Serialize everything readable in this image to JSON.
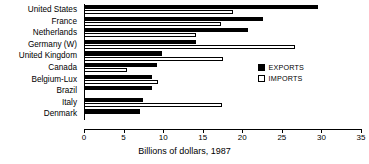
{
  "chart_data": {
    "type": "bar",
    "orientation": "horizontal",
    "title": "",
    "xlabel": "Billions of dollars, 1987",
    "ylabel": "",
    "xlim": [
      0,
      35
    ],
    "xticks": [
      0,
      5,
      10,
      15,
      20,
      25,
      30,
      35
    ],
    "xtick_labels": [
      "0",
      "5",
      "10",
      "15",
      "20",
      "25",
      "30",
      "35"
    ],
    "grid": false,
    "legend_position": "center-right",
    "categories": [
      "United States",
      "France",
      "Netherlands",
      "Germany (W)",
      "United Kingdom",
      "Canada",
      "Belgium-Lux",
      "Brazil",
      "Italy",
      "Denmark"
    ],
    "series": [
      {
        "name": "EXPORTS",
        "color": "#000000",
        "style": "filled",
        "values": [
          29.6,
          22.6,
          20.7,
          14.2,
          9.9,
          9.2,
          8.6,
          8.6,
          7.5,
          7.1
        ]
      },
      {
        "name": "IMPORTS",
        "color": "#ffffff",
        "style": "open",
        "values": [
          18.8,
          17.3,
          14.2,
          26.7,
          17.6,
          5.4,
          9.3,
          null,
          17.4,
          null
        ]
      }
    ]
  },
  "legend": {
    "items": [
      {
        "label": "EXPORTS",
        "swatch": "filled-square"
      },
      {
        "label": "IMPORTS",
        "swatch": "open-square"
      }
    ]
  },
  "axis": {
    "x_label": "Billions of dollars, 1987"
  }
}
